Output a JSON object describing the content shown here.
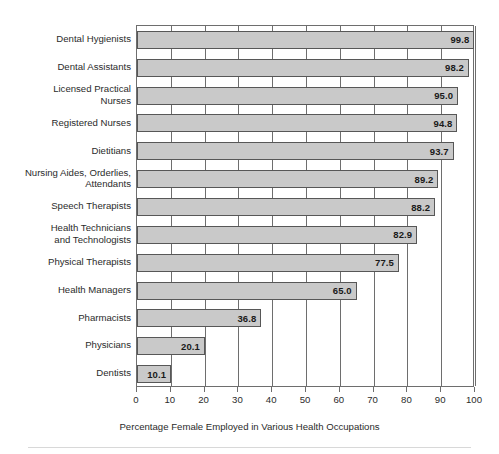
{
  "chart_data": {
    "type": "bar",
    "orientation": "horizontal",
    "title": "",
    "xlabel": "Percentage Female Employed in Various Health Occupations",
    "ylabel": "",
    "xlim": [
      0,
      100
    ],
    "xticks": [
      0,
      10,
      20,
      30,
      40,
      50,
      60,
      70,
      80,
      90,
      100
    ],
    "xtick_labels": [
      "0",
      "10",
      "20",
      "30",
      "40",
      "50",
      "60",
      "70",
      "80",
      "90",
      "100"
    ],
    "grid": "vertical",
    "legend": "none",
    "bar_color": "#c9c9c9",
    "bar_edge_color": "#575757",
    "frame_color": "#6e6e6e",
    "categories": [
      "Dental Hygienists",
      "Dental Assistants",
      "Licensed Practical\nNurses",
      "Registered Nurses",
      "Dietitians",
      "Nursing Aides, Orderlies,\nAttendants",
      "Speech Therapists",
      "Health Technicians\nand Technologists",
      "Physical Therapists",
      "Health Managers",
      "Pharmacists",
      "Physicians",
      "Dentists"
    ],
    "values": [
      99.8,
      98.2,
      95.0,
      94.8,
      93.7,
      89.2,
      88.2,
      82.9,
      77.5,
      65.0,
      36.8,
      20.1,
      10.1
    ],
    "value_labels": [
      "99.8",
      "98.2",
      "95.0",
      "94.8",
      "93.7",
      "89.2",
      "88.2",
      "82.9",
      "77.5",
      "65.0",
      "36.8",
      "20.1",
      "10.1"
    ]
  }
}
